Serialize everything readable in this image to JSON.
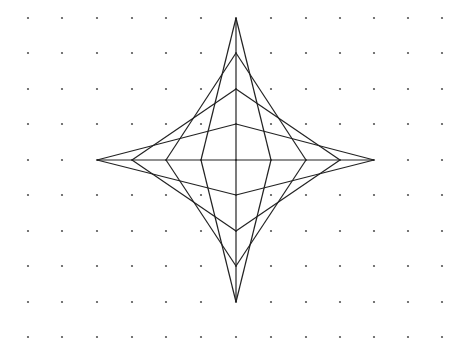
{
  "diagram": {
    "title": "",
    "type": "string-art star on dot grid",
    "background": "#ffffff",
    "dot_grid": {
      "color": "#555555",
      "radius": 1.1,
      "xs": [
        28,
        62,
        97,
        132,
        166,
        201,
        236,
        271,
        306,
        340,
        374,
        408,
        442
      ],
      "ys": [
        18,
        53,
        89,
        124,
        160,
        195,
        231,
        266,
        302,
        337
      ]
    },
    "axes": {
      "color": "#222222",
      "horizontal": [
        97,
        160,
        374,
        160
      ],
      "vertical": [
        236,
        18,
        236,
        302
      ]
    },
    "center": [
      236,
      160
    ],
    "line_color": "#222222",
    "line_width": 1.2,
    "segments": [
      [
        97,
        160,
        236,
        124
      ],
      [
        132,
        160,
        236,
        89
      ],
      [
        166,
        160,
        236,
        53
      ],
      [
        201,
        160,
        236,
        18
      ],
      [
        374,
        160,
        236,
        124
      ],
      [
        340,
        160,
        236,
        89
      ],
      [
        306,
        160,
        236,
        53
      ],
      [
        271,
        160,
        236,
        18
      ],
      [
        97,
        160,
        236,
        195
      ],
      [
        132,
        160,
        236,
        231
      ],
      [
        166,
        160,
        236,
        266
      ],
      [
        201,
        160,
        236,
        302
      ],
      [
        374,
        160,
        236,
        195
      ],
      [
        340,
        160,
        236,
        231
      ],
      [
        306,
        160,
        236,
        266
      ],
      [
        271,
        160,
        236,
        302
      ]
    ]
  }
}
